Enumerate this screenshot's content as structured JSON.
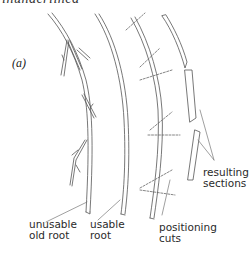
{
  "figure": {
    "heading_cropped": "inunderlined",
    "panel_label": "(a)",
    "labels": {
      "unusable_old_root": [
        "unusable",
        "old root"
      ],
      "usable_root": [
        "usable",
        "root"
      ],
      "positioning_cuts": [
        "positioning",
        "cuts"
      ],
      "resulting_sections": [
        "resulting",
        "sections"
      ]
    },
    "colors": {
      "stroke": "#555555",
      "text": "#2a2a2a",
      "background": "#ffffff"
    }
  }
}
